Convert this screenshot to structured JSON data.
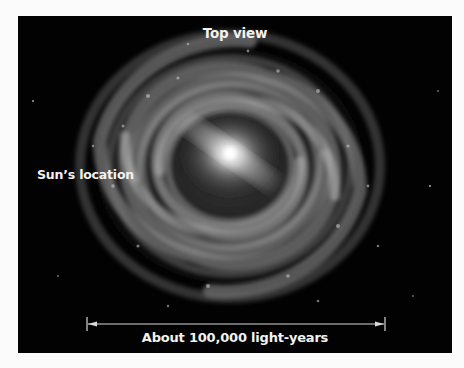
{
  "figure": {
    "title": "Top view",
    "sun_label": "Sun’s location",
    "scale_label": "About 100,000 light-years",
    "colors": {
      "background": "#fbfbfb",
      "panel": "#020202",
      "text": "#f2f2f2",
      "scale_bar": "#d8d8d8"
    }
  }
}
